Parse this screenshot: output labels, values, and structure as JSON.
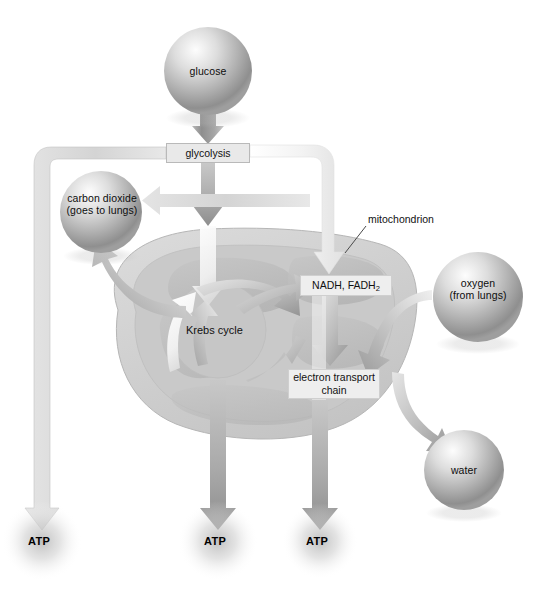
{
  "diagram": {
    "type": "biological-process-flow"
  },
  "nodes": {
    "glucose": {
      "label": "glucose",
      "shape": "sphere",
      "cx": 208,
      "cy": 71,
      "r": 44
    },
    "carbon_dioxide": {
      "line1": "carbon dioxide",
      "line2": "(goes to lungs)",
      "shape": "sphere",
      "cx": 101,
      "cy": 212,
      "r": 41
    },
    "oxygen": {
      "line1": "oxygen",
      "line2": "(from lungs)",
      "shape": "sphere",
      "cx": 478,
      "cy": 297,
      "r": 45
    },
    "water": {
      "label": "water",
      "shape": "sphere",
      "cx": 464,
      "cy": 470,
      "r": 40
    },
    "glycolysis": {
      "label": "glycolysis",
      "shape": "box",
      "x": 166,
      "y": 143,
      "w": 84,
      "h": 20
    },
    "nadh_fadh2": {
      "label": "NADH, FADH",
      "subscript": "2",
      "shape": "box",
      "x": 300,
      "y": 275,
      "w": 92,
      "h": 21
    },
    "electron_transport_chain": {
      "line1": "electron transport",
      "line2": "chain",
      "shape": "box",
      "x": 288,
      "y": 369,
      "w": 92,
      "h": 30
    },
    "krebs_cycle": {
      "label": "Krebs cycle",
      "shape": "inner-oval",
      "cx": 218,
      "cy": 330
    },
    "mitochondrion": {
      "label": "mitochondrion",
      "shape": "leader-label",
      "x": 368,
      "y": 213
    },
    "atp_1": {
      "label": "ATP",
      "cx": 42,
      "cy": 541
    },
    "atp_2": {
      "label": "ATP",
      "cx": 218,
      "cy": 541
    },
    "atp_3": {
      "label": "ATP",
      "cx": 320,
      "cy": 541
    }
  },
  "edges": [
    {
      "from": "glucose",
      "to": "glycolysis",
      "style": "thick-gray-down"
    },
    {
      "from": "glycolysis",
      "to": "atp_1",
      "style": "thin-gray-elbow-left-down"
    },
    {
      "from": "glycolysis",
      "to": "carbon_dioxide",
      "style": "light-left"
    },
    {
      "from": "glycolysis",
      "to": "krebs_cycle",
      "style": "gray-down-into-mitochondrion"
    },
    {
      "from": "glycolysis",
      "to": "nadh_fadh2",
      "style": "white-elbow-right-down"
    },
    {
      "from": "krebs_cycle",
      "to": "carbon_dioxide",
      "style": "curved-up-left"
    },
    {
      "from": "krebs_cycle",
      "to": "nadh_fadh2",
      "style": "curved-right"
    },
    {
      "from": "nadh_fadh2",
      "to": "electron_transport_chain",
      "style": "gray-down"
    },
    {
      "from": "oxygen",
      "to": "electron_transport_chain",
      "style": "curved-down-left"
    },
    {
      "from": "oxygen",
      "to": "water",
      "style": "curved-down-right"
    },
    {
      "from": "krebs_cycle",
      "to": "atp_2",
      "style": "thick-gray-down"
    },
    {
      "from": "electron_transport_chain",
      "to": "atp_3",
      "style": "thick-gray-down"
    }
  ],
  "colors": {
    "background": "#ffffff",
    "sphere_light": "#f2f2f2",
    "sphere_mid": "#b4b4b4",
    "sphere_dark": "#8a8a8a",
    "mito_outer": "#d2d2d2",
    "mito_inner": "#c0c0c0",
    "mito_crista": "#bdbdbd",
    "arrow_gray": "#9a9a9a",
    "arrow_light": "#d8d8d8",
    "arrow_white": "#f4f4f4",
    "box_fill": "#e9e9e9",
    "box_border": "#b9b9b9",
    "text": "#111111"
  }
}
